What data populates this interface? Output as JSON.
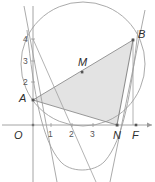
{
  "figure": {
    "type": "geometry-diagram",
    "width": 155,
    "height": 182,
    "background_color": "#ffffff",
    "stroke_color": "#8a8a8a",
    "axis_color": "#9a9a9a",
    "shade_color": "#e2e2e2",
    "label_color": "#3a3a3a"
  },
  "axes": {
    "x_axis_label": "",
    "y_axis_label": "",
    "origin_label": "O",
    "x_ticks": [
      {
        "label": "1",
        "x": 51
      },
      {
        "label": "2",
        "x": 72
      },
      {
        "label": "3",
        "x": 93
      }
    ],
    "y_ticks": [
      {
        "label": "2",
        "y": 82
      },
      {
        "label": "3",
        "y": 61
      },
      {
        "label": "4",
        "y": 39
      }
    ]
  },
  "points": [
    {
      "name": "A",
      "label": "A",
      "x": 33,
      "y": 100,
      "label_dx": -12,
      "label_dy": -5
    },
    {
      "name": "B",
      "label": "B",
      "x": 133,
      "y": 40,
      "label_dx": 4,
      "label_dy": -9
    },
    {
      "name": "M",
      "label": "M",
      "x": 82,
      "y": 72,
      "label_dx": -3,
      "label_dy": -13
    },
    {
      "name": "N",
      "label": "N",
      "x": 117,
      "y": 125,
      "label_dx": -2,
      "label_dy": 4
    },
    {
      "name": "F",
      "label": "F",
      "x": 136,
      "y": 125,
      "label_dx": -3,
      "label_dy": 4
    },
    {
      "name": "O",
      "label": "O",
      "x": 33,
      "y": 125,
      "label_dx": -18,
      "label_dy": 4
    }
  ],
  "shapes": {
    "triangle": {
      "name": "shaded-triangle-ABN",
      "vertices": "A,B,N",
      "fill": "#e2e2e2"
    },
    "circle": {
      "name": "circumscribed-circle",
      "cx": 83,
      "cy": 64,
      "r": 62
    },
    "parabola": {
      "name": "parabola",
      "vertex_x": 82,
      "vertex_y": 173
    }
  }
}
